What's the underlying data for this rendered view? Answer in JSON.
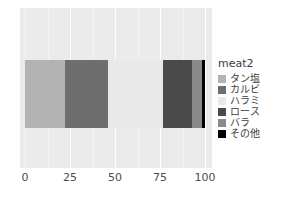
{
  "chart_data": {
    "type": "bar",
    "orientation": "horizontal",
    "stacked": true,
    "percent": true,
    "title": "",
    "xlabel": "",
    "ylabel": "",
    "xlim": [
      0,
      100
    ],
    "xticks": [
      0,
      25,
      50,
      75,
      100
    ],
    "xtick_labels": [
      "0",
      "25",
      "50",
      "75",
      "100"
    ],
    "grid": true,
    "legend": {
      "title": "meat2",
      "position": "right",
      "entries": [
        {
          "label": "タン塩",
          "color": "#b3b3b3"
        },
        {
          "label": "カルビ",
          "color": "#6e6e6e"
        },
        {
          "label": "ハラミ",
          "color": "#e9e9e9"
        },
        {
          "label": "ロース",
          "color": "#4a4a4a"
        },
        {
          "label": "バラ",
          "color": "#8a8a8a"
        },
        {
          "label": "その他",
          "color": "#000000"
        }
      ]
    },
    "categories": [
      "all"
    ],
    "series": [
      {
        "name": "タン塩",
        "color": "#b3b3b3",
        "values": [
          22.0
        ]
      },
      {
        "name": "カルビ",
        "color": "#6e6e6e",
        "values": [
          24.0
        ]
      },
      {
        "name": "ハラミ",
        "color": "#e9e9e9",
        "values": [
          30.5
        ]
      },
      {
        "name": "ロース",
        "color": "#4a4a4a",
        "values": [
          16.5
        ]
      },
      {
        "name": "バラ",
        "color": "#8a8a8a",
        "values": [
          5.3
        ]
      },
      {
        "name": "その他",
        "color": "#000000",
        "values": [
          1.7
        ]
      }
    ],
    "panel_background": "#ebebeb",
    "gridline_color": "#ffffff",
    "tick_label_color": "#4d4d4d"
  }
}
